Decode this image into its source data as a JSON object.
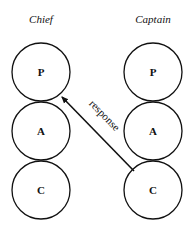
{
  "columns": [
    {
      "title": "Chief",
      "states": [
        "P",
        "A",
        "C"
      ]
    },
    {
      "title": "Captain",
      "states": [
        "P",
        "A",
        "C"
      ]
    }
  ],
  "arrow": {
    "label": "response",
    "from": "Captain.C",
    "to": "Chief.P"
  },
  "colors": {
    "stroke": "#111111",
    "background": "#ffffff"
  }
}
